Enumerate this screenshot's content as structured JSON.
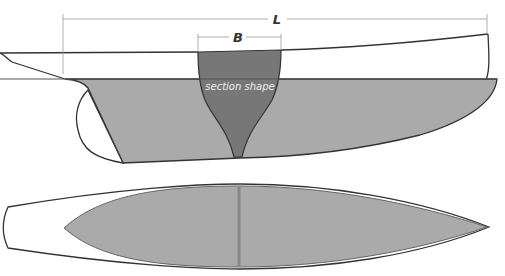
{
  "diagram": {
    "labels": {
      "length": "L",
      "beam": "B",
      "section": "section shape"
    },
    "colors": {
      "hull_outline": "#333333",
      "underwater": "#aaaaaa",
      "section_fill": "#777777",
      "dimension_line": "#999999",
      "waterline": "#555555",
      "plan_centerline": "#888888"
    },
    "views": [
      "profile",
      "plan"
    ]
  }
}
